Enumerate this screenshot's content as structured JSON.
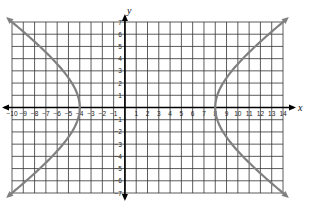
{
  "chart_data": {
    "type": "line",
    "title": "",
    "xlabel": "x",
    "ylabel": "y",
    "xlim": [
      -10,
      14
    ],
    "ylim": [
      -7,
      7
    ],
    "grid": true,
    "legend": null,
    "x_ticks": [
      -10,
      -9,
      -8,
      -7,
      -6,
      -5,
      -4,
      -3,
      -2,
      -1,
      1,
      2,
      3,
      4,
      5,
      6,
      7,
      8,
      9,
      10,
      11,
      12,
      13,
      14
    ],
    "y_ticks": [
      7,
      6,
      5,
      4,
      3,
      2,
      1,
      -1,
      -2,
      -3,
      -4,
      -5,
      -6,
      -7
    ],
    "series": [
      {
        "name": "hyperbola-left-branch",
        "description": "Left branch of horizontal hyperbola, vertex (-4, 0), arrows at both ends",
        "points": [
          [
            -10,
            7
          ],
          [
            -8.4,
            5
          ],
          [
            -6.6,
            3
          ],
          [
            -5.6,
            2
          ],
          [
            -4.7,
            1
          ],
          [
            -4,
            0
          ],
          [
            -4.7,
            -1
          ],
          [
            -5.6,
            -2
          ],
          [
            -6.6,
            -3
          ],
          [
            -8.4,
            -5
          ],
          [
            -10,
            -7
          ]
        ]
      },
      {
        "name": "hyperbola-right-branch",
        "description": "Right branch of horizontal hyperbola, vertex (8, 0), arrows at both ends",
        "points": [
          [
            14,
            7
          ],
          [
            12.4,
            5
          ],
          [
            10.6,
            3
          ],
          [
            9.6,
            2
          ],
          [
            8.7,
            1
          ],
          [
            8,
            0
          ],
          [
            8.7,
            -1
          ],
          [
            9.6,
            -2
          ],
          [
            10.6,
            -3
          ],
          [
            12.4,
            -5
          ],
          [
            14,
            -7
          ]
        ]
      }
    ],
    "annotations": {
      "center": [
        2,
        0
      ],
      "vertices": [
        [
          -4,
          0
        ],
        [
          8,
          0
        ]
      ],
      "equation_hint": "(x-2)^2/36 - y^2/(49/3) = 1"
    },
    "colors": {
      "curve": "#808080",
      "grid": "#333333",
      "axis": "#000000"
    }
  },
  "labels": {
    "x_axis": "x",
    "y_axis": "y"
  }
}
